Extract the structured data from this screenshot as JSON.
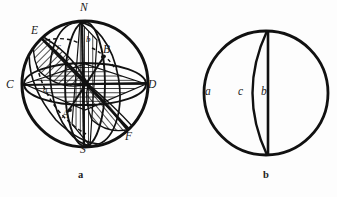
{
  "figure": {
    "background_color": "#fdfdfd",
    "ink_color": "#111111",
    "panels": [
      {
        "id": "a",
        "caption": "a",
        "caption_x": 78,
        "caption_y": 170,
        "circle": {
          "cx": 85,
          "cy": 84,
          "r": 63
        },
        "point_labels": [
          {
            "key": "N",
            "text": "N",
            "x": 80,
            "y": 2,
            "size": "cap"
          },
          {
            "key": "S",
            "text": "S",
            "x": 80,
            "y": 144,
            "size": "cap"
          },
          {
            "key": "C",
            "text": "C",
            "x": 6,
            "y": 79,
            "size": "cap"
          },
          {
            "key": "D",
            "text": "D",
            "x": 148,
            "y": 79,
            "size": "cap"
          },
          {
            "key": "E",
            "text": "E",
            "x": 31,
            "y": 25,
            "size": "cap"
          },
          {
            "key": "F",
            "text": "F",
            "x": 125,
            "y": 131,
            "size": "cap"
          },
          {
            "key": "A",
            "text": "A",
            "x": 62,
            "y": 109,
            "size": "cap"
          },
          {
            "key": "B",
            "text": "B",
            "x": 103,
            "y": 44,
            "size": "cap"
          }
        ],
        "plane_labels": [
          {
            "key": "a",
            "text": "a",
            "x": 43,
            "y": 85,
            "size": "small"
          },
          {
            "key": "b",
            "text": "b",
            "x": 86,
            "y": 35,
            "size": "small"
          },
          {
            "key": "c",
            "text": "c",
            "x": 57,
            "y": 42,
            "size": "small"
          }
        ]
      },
      {
        "id": "b",
        "caption": "b",
        "caption_x": 263,
        "caption_y": 170,
        "circle": {
          "cx": 266,
          "cy": 93,
          "r": 62
        },
        "pole_top_y": 31,
        "pole_bottom_y": 155,
        "lines": [
          {
            "key": "b",
            "type": "straight-diameter",
            "x": 268
          },
          {
            "key": "c",
            "type": "arc",
            "bulge_x": 242
          }
        ],
        "point_labels": [
          {
            "key": "a",
            "text": "a",
            "x": 205,
            "y": 86,
            "size": "cap"
          },
          {
            "key": "c",
            "text": "c",
            "x": 238,
            "y": 86,
            "size": "cap"
          },
          {
            "key": "b",
            "text": "b",
            "x": 261,
            "y": 86,
            "size": "cap"
          }
        ]
      }
    ]
  }
}
